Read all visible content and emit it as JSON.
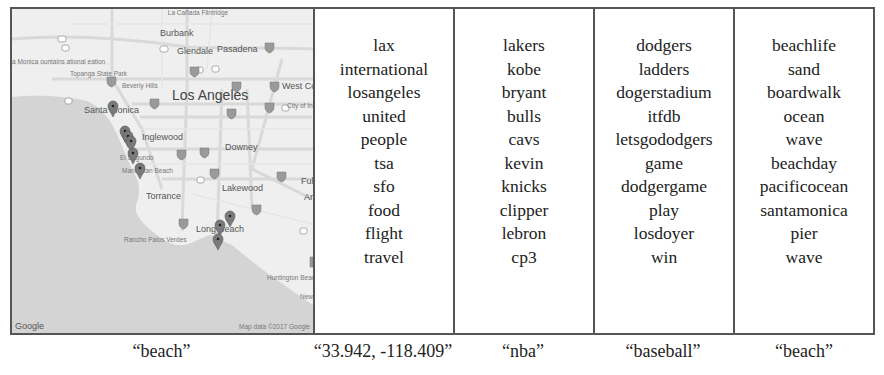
{
  "map": {
    "labels": {
      "burbank": "Burbank",
      "glendale": "Glendale",
      "pasadena": "Pasadena",
      "los_angeles": "Los Angeles",
      "beverly_hills": "Beverly Hills",
      "west_covina": "West Cov",
      "city_of_industry": "City of Industry",
      "santa_monica": "Santa Monica",
      "topanga": "Topanga State Park",
      "santa_monica_mountains": "a Monica ountains ational eation",
      "inglewood": "Inglewood",
      "downey": "Downey",
      "el_segundo": "El Segundo",
      "manhattan_beach": "Manhattan Beach",
      "torrance": "Torrance",
      "lakewood": "Lakewood",
      "fullerton": "Fullert",
      "anaheim": "Anah",
      "long_beach": "Long Beach",
      "rancho_palos_verdes": "Rancho Palos Verdes",
      "huntington_beach": "Huntington Beach",
      "newport_beach": "Newpo Beach",
      "la_canada": "La Cañada Flintridge"
    },
    "logo": "Google",
    "attribution": "Map data ©2017 Google",
    "markers": [
      {
        "x": 101,
        "y": 108
      },
      {
        "x": 113,
        "y": 127
      },
      {
        "x": 116,
        "y": 133
      },
      {
        "x": 119,
        "y": 138
      },
      {
        "x": 121,
        "y": 150
      },
      {
        "x": 128,
        "y": 166
      },
      {
        "x": 208,
        "y": 221
      },
      {
        "x": 218,
        "y": 212
      },
      {
        "x": 206,
        "y": 235
      }
    ]
  },
  "columns": [
    {
      "words": [
        "lax",
        "international",
        "losangeles",
        "united",
        "people",
        "tsa",
        "sfo",
        "food",
        "flight",
        "travel"
      ]
    },
    {
      "words": [
        "lakers",
        "kobe",
        "bryant",
        "bulls",
        "cavs",
        "kevin",
        "knicks",
        "clipper",
        "lebron",
        "cp3"
      ]
    },
    {
      "words": [
        "dodgers",
        "ladders",
        "dogerstadium",
        "itfdb",
        "letsgododgers",
        "game",
        "dodgergame",
        "play",
        "losdoyer",
        "win"
      ]
    },
    {
      "words": [
        "beachlife",
        "sand",
        "boardwalk",
        "ocean",
        "wave",
        "beachday",
        "pacificocean",
        "santamonica",
        "pier",
        "wave"
      ]
    }
  ],
  "captions": [
    "“beach”",
    "“33.942, -118.409”",
    "“nba”",
    "“baseball”",
    "“beach”"
  ]
}
